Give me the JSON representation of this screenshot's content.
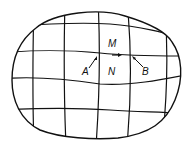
{
  "diagram": {
    "labels": {
      "M": "M",
      "N": "N",
      "A": "A",
      "B": "B"
    },
    "colors": {
      "stroke": "#111111",
      "background": "#ffffff"
    }
  }
}
